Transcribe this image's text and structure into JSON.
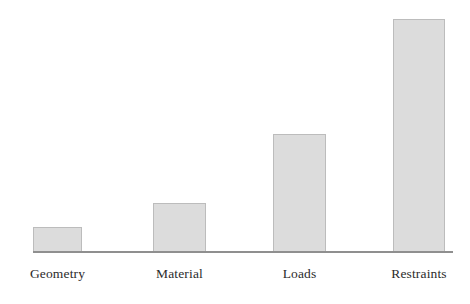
{
  "figure": {
    "background_color": "#ffffff",
    "width": 470,
    "height": 304
  },
  "style": {
    "bar_fill": "#dcdcdc",
    "bar_border": "#bcbcbc",
    "axis_color": "#8f8f8f",
    "label_color": "#2b2b2b"
  },
  "chart_data": {
    "type": "bar",
    "title": "",
    "subtitle": "",
    "xlabel": "",
    "ylabel": "",
    "categories": [
      "Geometry",
      "Material",
      "Loads",
      "Restraints"
    ],
    "values": [
      24,
      48,
      117,
      232
    ],
    "series": [
      {
        "name": "",
        "values": [
          24,
          48,
          117,
          232
        ]
      }
    ],
    "ylim": [
      0,
      240
    ],
    "grid": false,
    "legend": false,
    "legend_position": "none",
    "y_axis_visible": false,
    "y_tick_labels": [],
    "x_axis_visible": true,
    "x_tick_labels": [
      "Geometry",
      "Material",
      "Loads",
      "Restraints"
    ],
    "annotations": [],
    "data_labels": [],
    "bars": [
      {
        "label": "Geometry",
        "value": 24,
        "x": 33,
        "width": 49,
        "top": 228,
        "height": 24
      },
      {
        "label": "Material",
        "value": 48,
        "x": 153,
        "width": 53,
        "top": 204,
        "height": 48
      },
      {
        "label": "Loads",
        "value": 117,
        "x": 273,
        "width": 53,
        "top": 135,
        "height": 117
      },
      {
        "label": "Restraints",
        "value": 232,
        "x": 393,
        "width": 52,
        "top": 20,
        "height": 232
      }
    ]
  }
}
